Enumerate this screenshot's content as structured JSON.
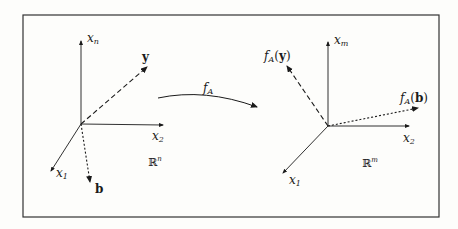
{
  "diagram": {
    "colors": {
      "ink": "#1a1a1a",
      "background": "#fdfdfb",
      "frame": "#333333"
    },
    "mapping_label": {
      "base": "f",
      "sub": "A"
    },
    "left_space": {
      "name": "ℝ",
      "exponent": "n",
      "axes": {
        "vertical": {
          "base": "x",
          "sub": "n"
        },
        "horizontal": {
          "base": "x",
          "sub": "2"
        },
        "diagonal": {
          "base": "x",
          "sub": "1"
        }
      },
      "vectors": [
        {
          "label": "y",
          "style": "dashed"
        },
        {
          "label": "b",
          "style": "dotted"
        }
      ]
    },
    "right_space": {
      "name": "ℝ",
      "exponent": "m",
      "axes": {
        "vertical": {
          "base": "x",
          "sub": "m"
        },
        "horizontal": {
          "base": "x",
          "sub": "2"
        },
        "diagonal": {
          "base": "x",
          "sub": "1"
        }
      },
      "vectors": [
        {
          "label_func": "f",
          "label_sub": "A",
          "label_arg": "y",
          "style": "dashed"
        },
        {
          "label_func": "f",
          "label_sub": "A",
          "label_arg": "b",
          "style": "dotted"
        }
      ]
    }
  }
}
